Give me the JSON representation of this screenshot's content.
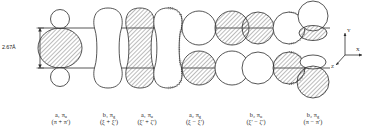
{
  "figure": {
    "type": "molecular-orbital-diagram",
    "dimension_label": "2.67Å",
    "axes": {
      "y": "Y",
      "x": "X",
      "z": "Z"
    },
    "stroke_color": "#2b2b2b",
    "hatch_color": "#555555",
    "background": "#ffffff",
    "orbitals": [
      {
        "id": "mo-1",
        "symmetry": "a₁ π",
        "symmetry_sub": "u",
        "combination": "(π + π')",
        "shape": "small-circles-large-ellipse",
        "fill": "hatched"
      },
      {
        "id": "mo-2",
        "symmetry": "b₁ π",
        "symmetry_sub": "g",
        "combination": "(ξ + ξ')",
        "shape": "peanut-open",
        "fill": "open"
      },
      {
        "id": "mo-3",
        "symmetry": "a₁ π",
        "symmetry_sub": "u",
        "combination": "(ξ' + ζ')",
        "shape": "peanut-hatched",
        "fill": "hatched"
      },
      {
        "id": "mo-4",
        "symmetry": "a₂ π",
        "symmetry_sub": "g",
        "combination": "(ξ − ξ')",
        "shape": "quad-circles",
        "fill": "alternating"
      },
      {
        "id": "mo-5",
        "symmetry": "b₂ π",
        "symmetry_sub": "u",
        "combination": "(ξ' − ζ')",
        "shape": "quad-circles",
        "fill": "alternating"
      },
      {
        "id": "mo-6",
        "symmetry": "b₂ π",
        "symmetry_sub": "g",
        "combination": "(π − π')",
        "shape": "circle-lens-stack",
        "fill": "alternating"
      }
    ]
  }
}
